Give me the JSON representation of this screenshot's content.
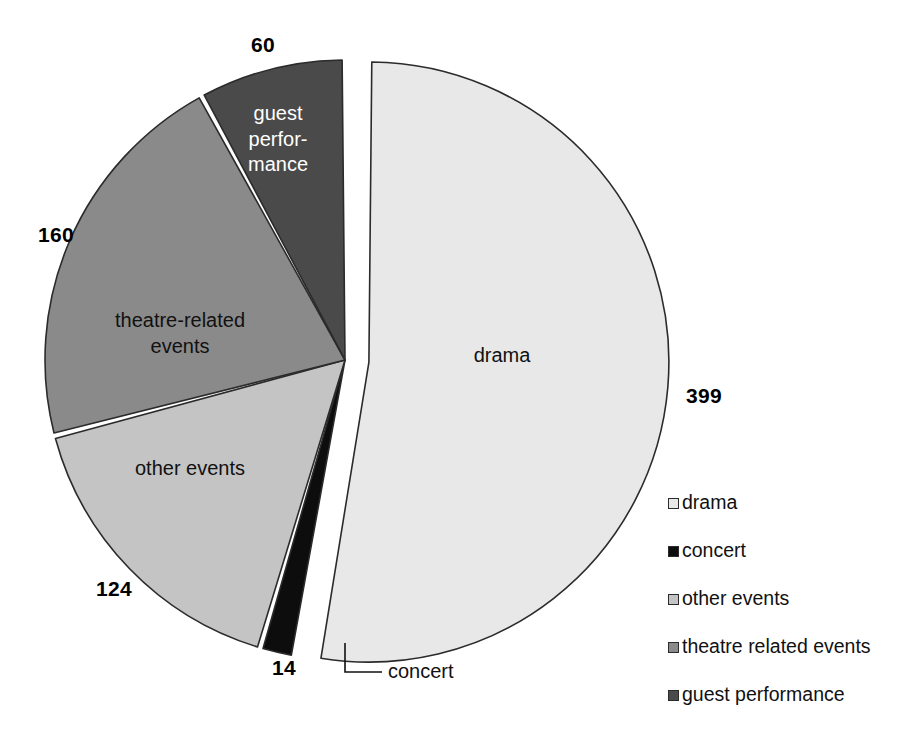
{
  "chart_data": {
    "type": "pie",
    "title": "",
    "categories": [
      "drama",
      "concert",
      "other events",
      "theatre-related events",
      "guest performance"
    ],
    "values": [
      399,
      14,
      124,
      160,
      60
    ],
    "total": 757,
    "legend_position": "right",
    "grid": false,
    "exploded_slice": "drama",
    "slices": [
      {
        "label": "drama",
        "value": 399,
        "value_text": "399",
        "color": "#e8e8e8",
        "label_color": "dark",
        "label_lines": [
          "drama"
        ]
      },
      {
        "label": "concert",
        "value": 14,
        "value_text": "14",
        "color": "#0d0d0d",
        "label_color": "dark",
        "label_lines": [
          "concert"
        ],
        "callout": true
      },
      {
        "label": "other events",
        "value": 124,
        "value_text": "124",
        "color": "#c4c4c4",
        "label_color": "dark",
        "label_lines": [
          "other events"
        ]
      },
      {
        "label": "theatre-related events",
        "value": 160,
        "value_text": "160",
        "color": "#8a8a8a",
        "label_color": "dark",
        "label_lines": [
          "theatre-related",
          "events"
        ]
      },
      {
        "label": "guest performance",
        "value": 60,
        "value_text": "60",
        "color": "#4a4a4a",
        "label_color": "light",
        "label_lines": [
          "guest",
          "perfor-",
          "mance"
        ]
      }
    ]
  },
  "labels": {
    "drama_value": "399",
    "concert_value": "14",
    "other_events_value": "124",
    "theatre_value": "160",
    "guest_value": "60",
    "drama_name": "drama",
    "concert_name": "concert",
    "other_events_name": "other events",
    "theatre_name_line1": "theatre-related",
    "theatre_name_line2": "events",
    "guest_name_line1": "guest",
    "guest_name_line2": "perfor-",
    "guest_name_line3": "mance"
  },
  "legend": {
    "items": [
      {
        "label": "drama",
        "color": "#e8e8e8"
      },
      {
        "label": "concert",
        "color": "#0d0d0d"
      },
      {
        "label": "other events",
        "color": "#c4c4c4"
      },
      {
        "label": "theatre related events",
        "color": "#8a8a8a"
      },
      {
        "label": "guest performance",
        "color": "#4a4a4a"
      }
    ]
  },
  "colors": {
    "drama": "#e8e8e8",
    "concert": "#0d0d0d",
    "other_events": "#c4c4c4",
    "theatre_related": "#8a8a8a",
    "guest_performance": "#4a4a4a",
    "outline": "#2b2b2b",
    "background": "#ffffff"
  }
}
